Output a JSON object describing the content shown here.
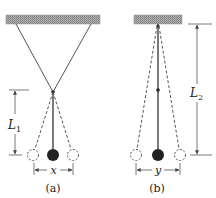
{
  "figure": {
    "panel_a": {
      "caption": "(a)",
      "length_label": "L",
      "length_subscript": "1",
      "spacing_label": "x"
    },
    "panel_b": {
      "caption": "(b)",
      "length_label": "L",
      "length_subscript": "2",
      "spacing_label": "y"
    }
  },
  "colors": {
    "line": "#444444",
    "ball": "#222222",
    "ceiling": "#9a9a9a",
    "ceiling_dark": "#6e6e6e"
  }
}
